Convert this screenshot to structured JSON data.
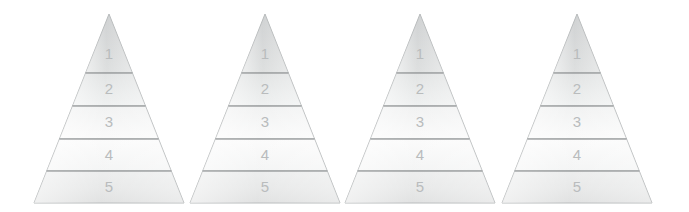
{
  "figure": {
    "type": "pyramid-diagram",
    "title": "",
    "background_color": "#ffffff",
    "width": 689,
    "height": 212,
    "pyramid_count": 4,
    "levels_per_pyramid": 5
  },
  "style": {
    "outline_color": "#b0b3b4",
    "divider_color": "#8f9293",
    "label_color": "#b9bcbd",
    "fill_top": "#d6d8d8",
    "fill_upper_mid": "#e2e4e4",
    "fill_mid": "#f2f3f3",
    "fill_lower_mid": "#fbfbfb",
    "fill_bottom": "#e9eaea",
    "sheen_color": "#ffffff"
  },
  "geometry": {
    "apex_y": 14,
    "base_y": 203,
    "dividers_y": [
      73,
      106,
      139,
      171
    ],
    "half_width_at_base": 75,
    "apex_x": [
      109,
      265,
      420,
      577
    ]
  },
  "pyramids": [
    {
      "id": "pyramid-1",
      "name": "pyramid-1",
      "apex_x": 109,
      "levels": [
        {
          "index": 1,
          "label": "1"
        },
        {
          "index": 2,
          "label": "2"
        },
        {
          "index": 3,
          "label": "3"
        },
        {
          "index": 4,
          "label": "4"
        },
        {
          "index": 5,
          "label": "5"
        }
      ]
    },
    {
      "id": "pyramid-2",
      "name": "pyramid-2",
      "apex_x": 265,
      "levels": [
        {
          "index": 1,
          "label": "1"
        },
        {
          "index": 2,
          "label": "2"
        },
        {
          "index": 3,
          "label": "3"
        },
        {
          "index": 4,
          "label": "4"
        },
        {
          "index": 5,
          "label": "5"
        }
      ]
    },
    {
      "id": "pyramid-3",
      "name": "pyramid-3",
      "apex_x": 420,
      "levels": [
        {
          "index": 1,
          "label": "1"
        },
        {
          "index": 2,
          "label": "2"
        },
        {
          "index": 3,
          "label": "3"
        },
        {
          "index": 4,
          "label": "4"
        },
        {
          "index": 5,
          "label": "5"
        }
      ]
    },
    {
      "id": "pyramid-4",
      "name": "pyramid-4",
      "apex_x": 577,
      "levels": [
        {
          "index": 1,
          "label": "1"
        },
        {
          "index": 2,
          "label": "2"
        },
        {
          "index": 3,
          "label": "3"
        },
        {
          "index": 4,
          "label": "4"
        },
        {
          "index": 5,
          "label": "5"
        }
      ]
    }
  ],
  "chart_data": {
    "type": "pyramid",
    "title": "",
    "xlabel": "",
    "ylabel": "",
    "series": [
      {
        "name": "pyramid-1",
        "categories": [
          "1",
          "2",
          "3",
          "4",
          "5"
        ],
        "values": [
          1,
          2,
          3,
          4,
          5
        ]
      },
      {
        "name": "pyramid-2",
        "categories": [
          "1",
          "2",
          "3",
          "4",
          "5"
        ],
        "values": [
          1,
          2,
          3,
          4,
          5
        ]
      },
      {
        "name": "pyramid-3",
        "categories": [
          "1",
          "2",
          "3",
          "4",
          "5"
        ],
        "values": [
          1,
          2,
          3,
          4,
          5
        ]
      },
      {
        "name": "pyramid-4",
        "categories": [
          "1",
          "2",
          "3",
          "4",
          "5"
        ],
        "values": [
          1,
          2,
          3,
          4,
          5
        ]
      }
    ],
    "legend": [],
    "grid": false
  }
}
